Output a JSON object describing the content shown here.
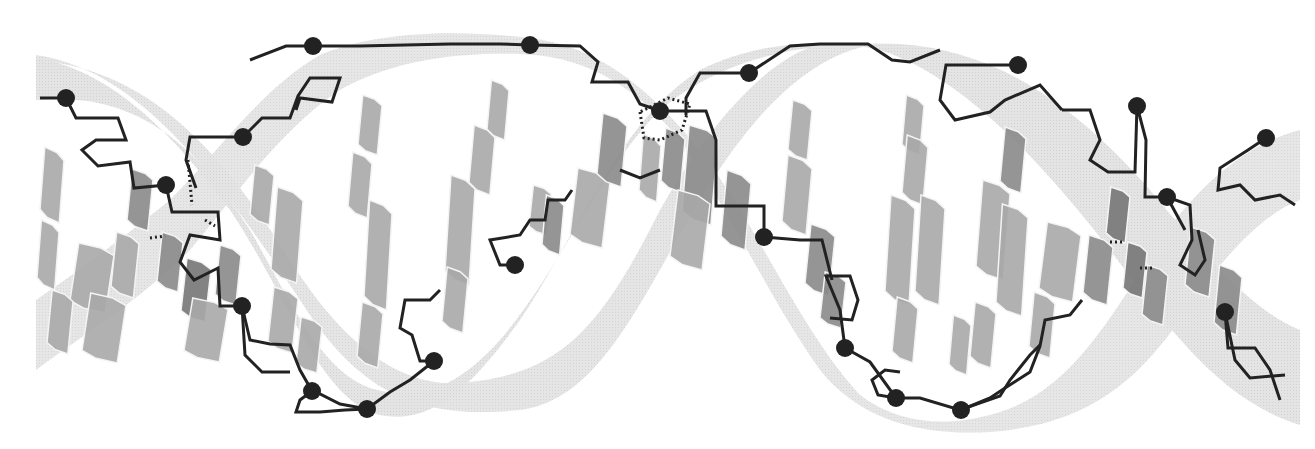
{
  "figure": {
    "style": "grayscale",
    "width": 1315,
    "height": 449,
    "colors": {
      "background": "#ffffff",
      "ribbon": "#e2e2e2",
      "ribbon_shadow": "#cfcfcf",
      "base_light": "#a9a9a9",
      "base_dark": "#8a8a8a",
      "base_darker": "#767676",
      "backbone": "#222222",
      "phosphate": "#222222",
      "base_edge": "#f4f4f4"
    },
    "phosphates": [
      [
        66,
        98
      ],
      [
        243,
        137
      ],
      [
        166,
        185
      ],
      [
        313,
        46
      ],
      [
        530,
        45
      ],
      [
        660,
        111
      ],
      [
        749,
        73
      ],
      [
        515,
        265
      ],
      [
        764,
        237
      ],
      [
        434,
        361
      ],
      [
        367,
        409
      ],
      [
        312,
        391
      ],
      [
        242,
        306
      ],
      [
        845,
        348
      ],
      [
        896,
        398
      ],
      [
        961,
        410
      ],
      [
        1018,
        65
      ],
      [
        1137,
        106
      ],
      [
        1167,
        197
      ],
      [
        1225,
        312
      ],
      [
        1266,
        138
      ]
    ],
    "bases": [
      {
        "cx": 52,
        "cy": 185,
        "w": 24,
        "h": 76,
        "tone": "base_light"
      },
      {
        "cx": 48,
        "cy": 255,
        "w": 22,
        "h": 70,
        "tone": "base_light"
      },
      {
        "cx": 92,
        "cy": 278,
        "w": 44,
        "h": 70,
        "tone": "base_light"
      },
      {
        "cx": 104,
        "cy": 328,
        "w": 44,
        "h": 70,
        "tone": "base_light"
      },
      {
        "cx": 60,
        "cy": 322,
        "w": 26,
        "h": 64,
        "tone": "base_light"
      },
      {
        "cx": 140,
        "cy": 200,
        "w": 26,
        "h": 62,
        "tone": "base_dark"
      },
      {
        "cx": 125,
        "cy": 265,
        "w": 28,
        "h": 66,
        "tone": "base_light"
      },
      {
        "cx": 170,
        "cy": 262,
        "w": 26,
        "h": 60,
        "tone": "base_dark"
      },
      {
        "cx": 196,
        "cy": 290,
        "w": 30,
        "h": 64,
        "tone": "base_darker"
      },
      {
        "cx": 206,
        "cy": 330,
        "w": 44,
        "h": 64,
        "tone": "base_light"
      },
      {
        "cx": 228,
        "cy": 275,
        "w": 26,
        "h": 60,
        "tone": "base_dark"
      },
      {
        "cx": 262,
        "cy": 195,
        "w": 24,
        "h": 60,
        "tone": "base_light"
      },
      {
        "cx": 287,
        "cy": 235,
        "w": 32,
        "h": 96,
        "tone": "base_light"
      },
      {
        "cx": 283,
        "cy": 320,
        "w": 30,
        "h": 66,
        "tone": "base_light"
      },
      {
        "cx": 309,
        "cy": 345,
        "w": 26,
        "h": 56,
        "tone": "base_light"
      },
      {
        "cx": 370,
        "cy": 125,
        "w": 24,
        "h": 60,
        "tone": "base_light"
      },
      {
        "cx": 360,
        "cy": 185,
        "w": 24,
        "h": 66,
        "tone": "base_light"
      },
      {
        "cx": 378,
        "cy": 255,
        "w": 28,
        "h": 110,
        "tone": "base_light"
      },
      {
        "cx": 370,
        "cy": 335,
        "w": 26,
        "h": 66,
        "tone": "base_light"
      },
      {
        "cx": 498,
        "cy": 110,
        "w": 22,
        "h": 60,
        "tone": "base_light"
      },
      {
        "cx": 482,
        "cy": 160,
        "w": 26,
        "h": 70,
        "tone": "base_light"
      },
      {
        "cx": 460,
        "cy": 230,
        "w": 30,
        "h": 110,
        "tone": "base_light"
      },
      {
        "cx": 455,
        "cy": 300,
        "w": 26,
        "h": 66,
        "tone": "base_light"
      },
      {
        "cx": 540,
        "cy": 210,
        "w": 22,
        "h": 50,
        "tone": "base_light"
      },
      {
        "cx": 553,
        "cy": 225,
        "w": 22,
        "h": 60,
        "tone": "base_dark"
      },
      {
        "cx": 590,
        "cy": 208,
        "w": 40,
        "h": 80,
        "tone": "base_light"
      },
      {
        "cx": 612,
        "cy": 150,
        "w": 30,
        "h": 74,
        "tone": "base_dark"
      },
      {
        "cx": 650,
        "cy": 168,
        "w": 22,
        "h": 68,
        "tone": "base_light"
      },
      {
        "cx": 673,
        "cy": 160,
        "w": 24,
        "h": 64,
        "tone": "base_dark"
      },
      {
        "cx": 700,
        "cy": 175,
        "w": 36,
        "h": 100,
        "tone": "base_dark"
      },
      {
        "cx": 690,
        "cy": 230,
        "w": 40,
        "h": 80,
        "tone": "base_light"
      },
      {
        "cx": 736,
        "cy": 210,
        "w": 30,
        "h": 80,
        "tone": "base_dark"
      },
      {
        "cx": 800,
        "cy": 130,
        "w": 24,
        "h": 60,
        "tone": "base_light"
      },
      {
        "cx": 797,
        "cy": 195,
        "w": 30,
        "h": 80,
        "tone": "base_light"
      },
      {
        "cx": 820,
        "cy": 260,
        "w": 30,
        "h": 72,
        "tone": "base_dark"
      },
      {
        "cx": 833,
        "cy": 300,
        "w": 26,
        "h": 56,
        "tone": "base_dark"
      },
      {
        "cx": 913,
        "cy": 125,
        "w": 22,
        "h": 60,
        "tone": "base_light"
      },
      {
        "cx": 915,
        "cy": 170,
        "w": 26,
        "h": 70,
        "tone": "base_light"
      },
      {
        "cx": 900,
        "cy": 250,
        "w": 30,
        "h": 110,
        "tone": "base_light"
      },
      {
        "cx": 930,
        "cy": 250,
        "w": 30,
        "h": 110,
        "tone": "base_light"
      },
      {
        "cx": 905,
        "cy": 330,
        "w": 26,
        "h": 66,
        "tone": "base_light"
      },
      {
        "cx": 1013,
        "cy": 160,
        "w": 26,
        "h": 66,
        "tone": "base_dark"
      },
      {
        "cx": 993,
        "cy": 230,
        "w": 34,
        "h": 100,
        "tone": "base_light"
      },
      {
        "cx": 1012,
        "cy": 260,
        "w": 32,
        "h": 112,
        "tone": "base_light"
      },
      {
        "cx": 983,
        "cy": 335,
        "w": 26,
        "h": 66,
        "tone": "base_light"
      },
      {
        "cx": 960,
        "cy": 345,
        "w": 22,
        "h": 60,
        "tone": "base_light"
      },
      {
        "cx": 1060,
        "cy": 262,
        "w": 42,
        "h": 80,
        "tone": "base_light"
      },
      {
        "cx": 1042,
        "cy": 325,
        "w": 26,
        "h": 66,
        "tone": "base_light"
      },
      {
        "cx": 1098,
        "cy": 270,
        "w": 30,
        "h": 70,
        "tone": "base_dark"
      },
      {
        "cx": 1118,
        "cy": 215,
        "w": 24,
        "h": 56,
        "tone": "base_darker"
      },
      {
        "cx": 1135,
        "cy": 270,
        "w": 24,
        "h": 56,
        "tone": "base_darker"
      },
      {
        "cx": 1155,
        "cy": 295,
        "w": 26,
        "h": 60,
        "tone": "base_dark"
      },
      {
        "cx": 1200,
        "cy": 262,
        "w": 30,
        "h": 70,
        "tone": "base_dark"
      },
      {
        "cx": 1228,
        "cy": 300,
        "w": 28,
        "h": 70,
        "tone": "base_dark"
      }
    ],
    "backbones": [
      "M40,98 L66,98 L76,118 L118,118 L126,140 L96,140 L82,150 L98,166 L130,162 L134,188 L166,185",
      "M166,185 L172,212 L218,212 L220,240 L190,235 L180,262 L194,280 L218,268 L220,306 L242,306",
      "M243,137 L190,137 L186,160 L196,188 M243,137 L262,118 L290,118 L298,96 L310,78 L340,78 L332,102 L300,98 L296,110",
      "M313,46 L286,46 L250,60 M313,46 L360,46 L450,44 L500,44 L530,45",
      "M530,45 L580,46 L598,62 L592,82 L628,82 L640,104 L660,111",
      "M660,111 L706,111 L716,140 L716,206 L764,206 L764,237",
      "M749,73 L700,73 L686,98 L686,115",
      "M749,73 L790,46 L820,44 L868,44 L892,60 L910,62 L940,50",
      "M1018,65 L946,65 L940,100 L955,120 L990,112 L1005,100 L1040,85 L1062,110",
      "M1062,110 L1090,110 L1100,140 L1090,160 L1108,172 L1135,172 L1137,106",
      "M1137,106 L1146,140 L1145,197 L1167,197 L1190,205 L1192,240 L1180,265 L1195,275 L1205,260 L1198,230",
      "M1167,197 L1185,230 M1225,312 L1228,348 L1255,348 L1270,370 L1280,400 M1225,312 L1235,360 L1250,378 L1285,375",
      "M1266,138 L1248,150 L1220,168 L1218,190 L1240,185 L1255,200 L1280,195 L1295,205",
      "M845,348 L840,310 L826,276 L850,276 L858,300 L852,320 L830,318",
      "M845,348 L870,362 L896,398 L920,398 L960,410 L1000,396 L1010,380 L1030,355 L1040,345",
      "M896,398 L878,395 L872,380 L885,370 L900,372",
      "M961,410 L990,398 L1005,388 L1030,372 L1040,346 L1045,320 L1070,315 L1082,300",
      "M515,265 L500,265 L490,240 L520,235 L530,220 L545,220 L548,200 L565,200 L572,190",
      "M434,361 L420,361 L412,335 L400,328 L405,300 L430,300 L440,290",
      "M434,361 L410,380 L390,392 L367,409 L340,404 L316,392 L312,391",
      "M312,391 L300,400 L296,412 L320,412 L345,410 L367,409",
      "M242,306 L250,340 L270,344 L290,345 L300,370 L312,391",
      "M242,306 L245,355 L262,372 L290,372",
      "M764,237 L800,240 L822,240 L832,280",
      "M620,170 L640,178 L660,170"
    ],
    "dotted_bonds": [
      "M188,160 L192,205",
      "M205,220 L215,226",
      "M150,238 L165,236",
      "M1140,268 L1155,268",
      "M1110,242 L1125,242",
      "M640,112 L644,138 L660,140 L682,130 L690,104 L668,98 Z"
    ]
  }
}
